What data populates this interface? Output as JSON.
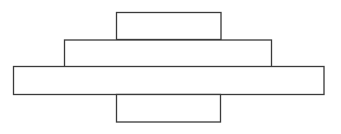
{
  "canvas": {
    "width": 341,
    "height": 134,
    "background": "#ffffff"
  },
  "diagram": {
    "stroke_color": "#3a3a3a",
    "fill_color": "#ffffff",
    "rectangles": [
      {
        "id": "top-block",
        "x": 116.5,
        "y": 12.5,
        "width": 104.5,
        "height": 27
      },
      {
        "id": "middle-block",
        "x": 64.5,
        "y": 40,
        "width": 207,
        "height": 27.5
      },
      {
        "id": "wide-block",
        "x": 13.5,
        "y": 66.5,
        "width": 310.5,
        "height": 28
      },
      {
        "id": "bottom-block",
        "x": 116.5,
        "y": 94.5,
        "width": 104,
        "height": 27.5
      }
    ]
  }
}
